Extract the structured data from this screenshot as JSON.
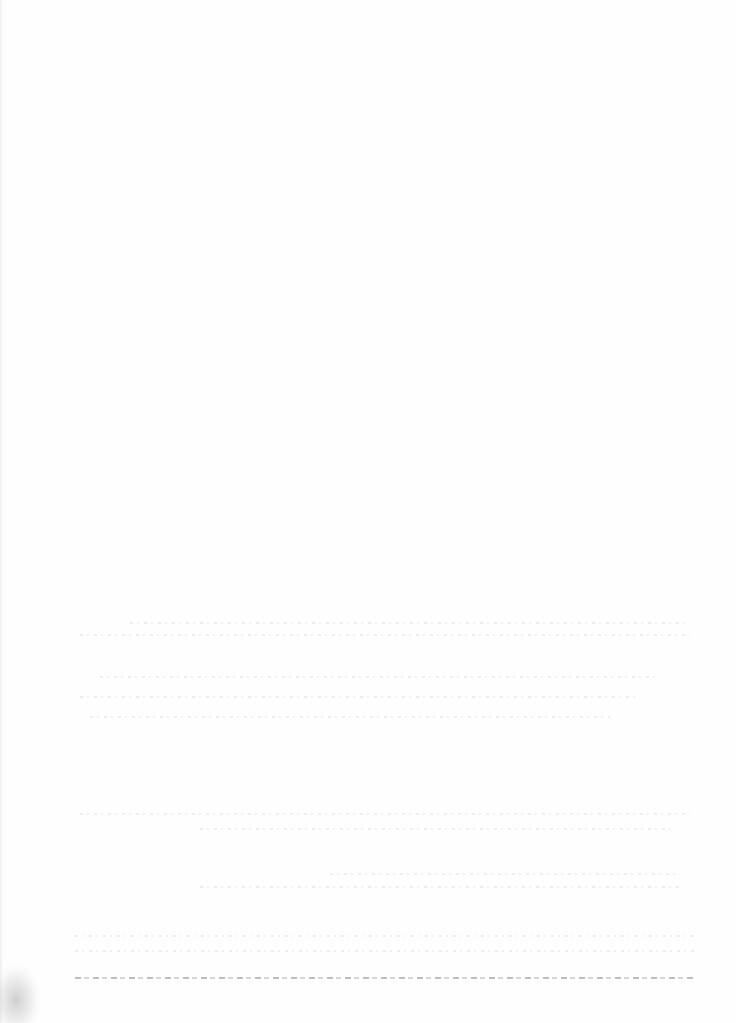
{
  "document": {
    "type": "blank scanned page",
    "visible_text": ""
  }
}
